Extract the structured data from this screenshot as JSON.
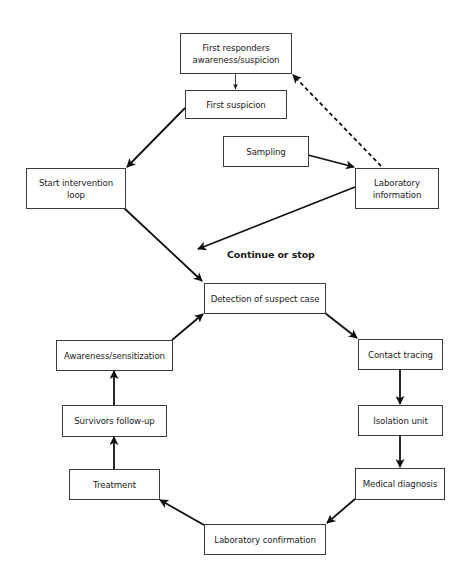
{
  "diagram": {
    "type": "flowchart",
    "nodes": {
      "first_responders": {
        "label": "First responders awareness/suspicion",
        "line1": "First responders",
        "line2": "awareness/suspicion"
      },
      "first_suspicion": {
        "label": "First suspicion"
      },
      "start_intervention": {
        "label": "Start intervention loop",
        "line1": "Start intervention",
        "line2": "loop"
      },
      "sampling": {
        "label": "Sampling"
      },
      "laboratory_information": {
        "label": "Laboratory information",
        "line1": "Laboratory",
        "line2": "information"
      },
      "detection": {
        "label": "Detection of suspect case"
      },
      "awareness": {
        "label": "Awareness/sensitization"
      },
      "contact_tracing": {
        "label": "Contact tracing"
      },
      "survivors": {
        "label": "Survivors follow-up"
      },
      "isolation": {
        "label": "Isolation unit"
      },
      "treatment": {
        "label": "Treatment"
      },
      "medical_diagnosis": {
        "label": "Medical diagnosis"
      },
      "laboratory_confirmation": {
        "label": "Laboratory confirmation"
      }
    },
    "annotations": {
      "continue_or_stop": "Continue or stop"
    },
    "edges": [
      {
        "from": "First responders awareness/suspicion",
        "to": "First suspicion",
        "style": "solid-thin"
      },
      {
        "from": "First suspicion",
        "to": "Start intervention loop",
        "style": "solid"
      },
      {
        "from": "Sampling",
        "to": "Laboratory information",
        "style": "solid"
      },
      {
        "from": "Laboratory information",
        "to": "First responders awareness/suspicion",
        "style": "dashed"
      },
      {
        "from": "Laboratory information",
        "to": "Continue or stop",
        "style": "solid"
      },
      {
        "from": "Start intervention loop",
        "to": "Detection of suspect case",
        "style": "solid"
      },
      {
        "from": "Detection of suspect case",
        "to": "Contact tracing",
        "style": "solid"
      },
      {
        "from": "Contact tracing",
        "to": "Isolation unit",
        "style": "solid"
      },
      {
        "from": "Isolation unit",
        "to": "Medical diagnosis",
        "style": "solid"
      },
      {
        "from": "Medical diagnosis",
        "to": "Laboratory confirmation",
        "style": "solid"
      },
      {
        "from": "Laboratory confirmation",
        "to": "Treatment",
        "style": "solid"
      },
      {
        "from": "Treatment",
        "to": "Survivors follow-up",
        "style": "solid"
      },
      {
        "from": "Survivors follow-up",
        "to": "Awareness/sensitization",
        "style": "solid"
      },
      {
        "from": "Awareness/sensitization",
        "to": "Detection of suspect case",
        "style": "solid"
      }
    ]
  },
  "colors": {
    "line": "#111111",
    "border": "#3a3a3a",
    "background": "#ffffff"
  }
}
